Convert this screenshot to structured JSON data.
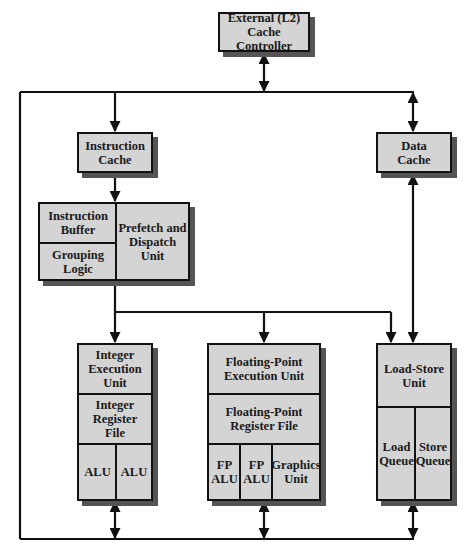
{
  "diagram": {
    "l2_cache_controller": "External (L2)\nCache Controller",
    "instruction_cache": "Instruction\nCache",
    "data_cache": "Data\nCache",
    "fetch_unit": {
      "instruction_buffer": "Instruction\nBuffer",
      "grouping_logic": "Grouping\nLogic",
      "prefetch_dispatch": "Prefetch and\nDispatch\nUnit"
    },
    "integer_unit": {
      "execution": "Integer\nExecution\nUnit",
      "register_file": "Integer\nRegister\nFile",
      "alus": [
        "ALU",
        "ALU"
      ]
    },
    "fp_unit": {
      "execution": "Floating-Point\nExecution Unit",
      "register_file": "Floating-Point\nRegister File",
      "units": [
        "FP\nALU",
        "FP\nALU",
        "Graphics\nUnit"
      ]
    },
    "load_store_unit": {
      "title": "Load-Store\nUnit",
      "queues": [
        "Load\nQueue",
        "Store\nQueue"
      ]
    },
    "colors": {
      "box_fill": "#d4d4d4",
      "line": "#111111",
      "shadow": "#555555"
    }
  }
}
